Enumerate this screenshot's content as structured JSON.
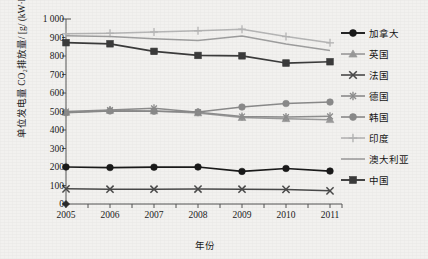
{
  "chart_data": {
    "type": "line",
    "title": "",
    "xlabel": "年份",
    "ylabel": "单位发电量 CO₂排放量/ [g/ (kW·h) ]",
    "x": [
      2005,
      2006,
      2007,
      2008,
      2009,
      2010,
      2011
    ],
    "categories": [
      "2005",
      "2006",
      "2007",
      "2008",
      "2009",
      "2010",
      "2011"
    ],
    "ylim": [
      0,
      1000
    ],
    "ytick_labels": [
      "0",
      "100",
      "200",
      "300",
      "400",
      "500",
      "600",
      "700",
      "800",
      "900",
      "1 000"
    ],
    "ytick_values": [
      0,
      100,
      200,
      300,
      400,
      500,
      600,
      700,
      800,
      900,
      1000
    ],
    "grid": false,
    "legend_position": "right",
    "series": [
      {
        "name": "加拿大",
        "marker": "circle",
        "color": "#1a1a1a",
        "values": [
          200,
          197,
          199,
          200,
          176,
          192,
          178
        ]
      },
      {
        "name": "英国",
        "marker": "triangle",
        "color": "#9a9a9a",
        "values": [
          495,
          506,
          503,
          492,
          467,
          461,
          456
        ]
      },
      {
        "name": "法国",
        "marker": "x",
        "color": "#4a4a4a",
        "values": [
          82,
          80,
          80,
          81,
          80,
          79,
          71
        ]
      },
      {
        "name": "德国",
        "marker": "asterisk",
        "color": "#8d8d8d",
        "values": [
          500,
          508,
          517,
          496,
          473,
          470,
          474
        ]
      },
      {
        "name": "韩国",
        "marker": "circle",
        "color": "#8a8a8a",
        "values": [
          493,
          503,
          502,
          497,
          524,
          543,
          551
        ]
      },
      {
        "name": "印度",
        "marker": "plus",
        "color": "#b5b5b5",
        "values": [
          920,
          923,
          930,
          936,
          945,
          905,
          871
        ]
      },
      {
        "name": "澳大利亚",
        "marker": "none",
        "color": "#9e9e9e",
        "values": [
          910,
          905,
          893,
          884,
          908,
          865,
          830
        ]
      },
      {
        "name": "中国",
        "marker": "square",
        "color": "#3b3b3b",
        "values": [
          872,
          866,
          825,
          803,
          801,
          762,
          769
        ]
      }
    ],
    "origin_marker": {
      "name": "origin-diamond",
      "x": 2005,
      "y": 0,
      "color": "#2a2a2a"
    }
  },
  "legend": {
    "items": [
      {
        "label": "加拿大"
      },
      {
        "label": "英国"
      },
      {
        "label": "法国"
      },
      {
        "label": "德国"
      },
      {
        "label": "韩国"
      },
      {
        "label": "印度"
      },
      {
        "label": "澳大利亚"
      },
      {
        "label": "中国"
      }
    ]
  }
}
